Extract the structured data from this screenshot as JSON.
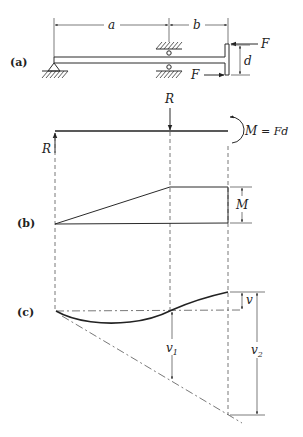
{
  "panels": {
    "a": {
      "label": "(a)"
    },
    "b": {
      "label": "(b)"
    },
    "c": {
      "label": "(c)"
    }
  },
  "beam": {
    "dim_a": "a",
    "dim_b": "b",
    "dim_d": "d",
    "force_top": "F",
    "force_bottom": "F"
  },
  "free_body": {
    "reaction_top": "R",
    "reaction_left": "R",
    "moment_label": "M",
    "moment_equation": "= Fd"
  },
  "moment_diagram": {
    "dim_label": "M"
  },
  "deflection": {
    "v_label": "v",
    "v1_label": "v",
    "v1_sub": "1",
    "v2_label": "v",
    "v2_sub": "2"
  }
}
